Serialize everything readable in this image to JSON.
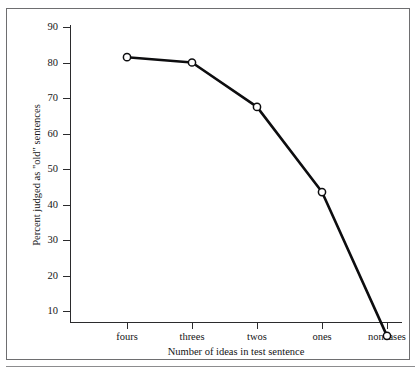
{
  "chart_data": {
    "type": "line",
    "title": "",
    "subtitle": "",
    "xlabel": "Number of ideas in test sentence",
    "ylabel": "Percent judged as \"old\" sentences",
    "categories": [
      "fours",
      "threes",
      "twos",
      "ones",
      "noncases"
    ],
    "values": [
      81.5,
      80,
      67.5,
      43.5,
      3
    ],
    "series": [
      {
        "name": "Percent judged as \"old\"",
        "values": [
          81.5,
          80,
          67.5,
          43.5,
          3
        ],
        "marker": "open-circle",
        "line_color": "#0d0d0f",
        "marker_fill": "#ffffff"
      }
    ],
    "ylim": [
      0,
      90
    ],
    "yticks": [
      10,
      20,
      30,
      40,
      50,
      60,
      70,
      80,
      90
    ],
    "ytick_labels": [
      "10",
      "20",
      "30",
      "40",
      "50",
      "60",
      "70",
      "80",
      "90"
    ],
    "xtick_labels": [
      "fours",
      "threes",
      "twos",
      "ones",
      "noncases"
    ],
    "grid": false,
    "legend": false,
    "legend_position": "none",
    "axis_color": "#2b2b2d",
    "background": "#ffffff"
  },
  "figure": {
    "frame_border_color": "#6e6e70"
  }
}
